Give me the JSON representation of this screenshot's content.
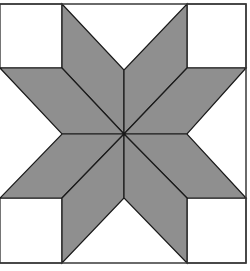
{
  "figure": {
    "colors": {
      "diamond_fill": "#8f8f8f",
      "background": "#ffffff",
      "stroke": "#1a1a1a"
    },
    "center": [
      124,
      134
    ],
    "diamond_count": 8,
    "corner_square_count": 4
  }
}
